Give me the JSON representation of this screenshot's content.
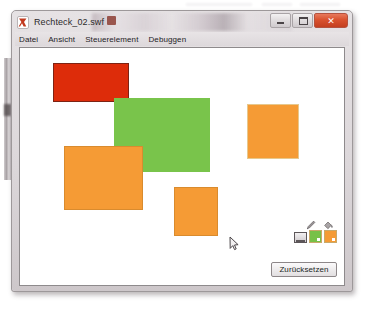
{
  "window": {
    "title": "Rechteck_02.swf",
    "icon": "flash-swf-icon",
    "controls": {
      "minimize_label": "Minimieren",
      "maximize_label": "Maximieren",
      "close_label": "Schließen",
      "close_glyph": "✕"
    }
  },
  "menubar": {
    "items": [
      {
        "label": "Datei"
      },
      {
        "label": "Ansicht"
      },
      {
        "label": "Steuerelement"
      },
      {
        "label": "Debuggen"
      }
    ]
  },
  "stage": {
    "background": "#ffffff",
    "shapes": [
      {
        "name": "rectangle-red",
        "fill": "#dd2c0a",
        "stroke": "#7d2314",
        "x": 33,
        "y": 15,
        "w": 76,
        "h": 39
      },
      {
        "name": "rectangle-green",
        "fill": "#79c44b",
        "stroke": "#79c44b",
        "x": 94,
        "y": 50,
        "w": 96,
        "h": 74
      },
      {
        "name": "rectangle-orange-left",
        "fill": "#f59b35",
        "stroke": "#d98b2e",
        "x": 44,
        "y": 98,
        "w": 79,
        "h": 64
      },
      {
        "name": "rectangle-orange-right",
        "fill": "#f59b35",
        "stroke": "#e7c88d",
        "x": 227,
        "y": 56,
        "w": 52,
        "h": 55
      },
      {
        "name": "rectangle-orange-bottom",
        "fill": "#f59b35",
        "stroke": "#d98b2e",
        "x": 154,
        "y": 139,
        "w": 44,
        "h": 49
      }
    ]
  },
  "tools": {
    "stroke_tool": {
      "name": "pencil-icon",
      "label": "Linienfarbe"
    },
    "fill_tool": {
      "name": "paint-bucket-icon",
      "label": "Füllfarbe"
    },
    "swatches": [
      {
        "name": "monitor-swatch",
        "color": "#cfcacd",
        "label": "Hintergrund"
      },
      {
        "name": "green-swatch",
        "color": "#77c148",
        "label": "Grün"
      },
      {
        "name": "orange-swatch",
        "color": "#f59b35",
        "label": "Orange"
      }
    ]
  },
  "reset_button": {
    "label": "Zurücksetzen"
  },
  "cursor": {
    "x": 209,
    "y": 188,
    "type": "arrow-pointer"
  }
}
